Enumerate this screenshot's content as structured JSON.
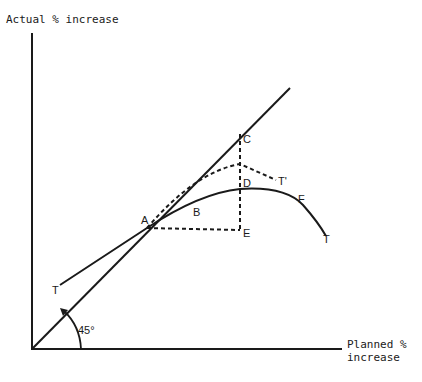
{
  "diagram": {
    "y_axis_label": "Actual % increase",
    "x_axis_label_line1": "Planned %",
    "x_axis_label_line2": "increase",
    "angle_label": "45°",
    "points": {
      "A": "A",
      "B": "B",
      "C": "C",
      "D": "D",
      "E": "E",
      "F": "F",
      "T_start": "T",
      "T_end": "T",
      "T_prime": "T'"
    },
    "colors": {
      "ink": "#1a1a1a",
      "background": "#ffffff"
    }
  }
}
